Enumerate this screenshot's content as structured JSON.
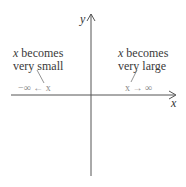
{
  "axes": {
    "x_label": "x",
    "y_label": "y"
  },
  "left_annotation": {
    "var": "x",
    "line1_rest": " becomes",
    "line2": "very small",
    "notation": "−∞ ← x"
  },
  "right_annotation": {
    "var": "x",
    "line1_rest": " becomes",
    "line2": "very large",
    "notation": "x → ∞"
  },
  "colors": {
    "axis": "#555555",
    "text": "#3a3a3a",
    "notation": "#8a8a8a"
  }
}
